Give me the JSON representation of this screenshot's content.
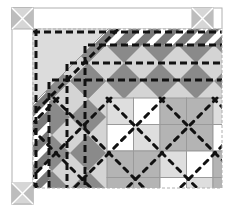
{
  "diagram": {
    "type": "quilt-corner-layout",
    "colors": {
      "background": "#ffffff",
      "border_outline": "#b0b0b0",
      "corner_block_light": "#d6d6d6",
      "corner_block_dark": "#bdbdbd",
      "diamond_dark": "#8a8a8a",
      "diamond_light": "#d4d4d4",
      "stripe_dark": "#7a7a7a",
      "stripe_light": "#ffffff",
      "corner_triangle": "#dcdcdc",
      "check_white": "#ffffff",
      "check_light": "#dedede",
      "check_mid": "#b4b4b4",
      "quilting_line": "#111111"
    },
    "outer_border": {
      "x": 12,
      "y": 8,
      "width": 210,
      "height": 88
    },
    "corner_blocks": [
      {
        "name": "top-left",
        "x": 12,
        "y": 8,
        "size": 21
      },
      {
        "name": "top-right",
        "x": 192,
        "y": 8,
        "size": 21
      },
      {
        "name": "bottom-left",
        "x": 12,
        "y": 183,
        "size": 21
      }
    ],
    "checker_grid": {
      "x": 107,
      "y": 98,
      "cell": 26.5,
      "rows": [
        [
          "light",
          "white",
          "mid",
          "mid",
          "light"
        ],
        [
          "white",
          "light",
          "mid",
          "mid",
          "white"
        ],
        [
          "mid",
          "mid",
          "light",
          "white",
          "mid"
        ],
        [
          "mid",
          "mid",
          "white",
          "light",
          "mid"
        ]
      ]
    }
  }
}
